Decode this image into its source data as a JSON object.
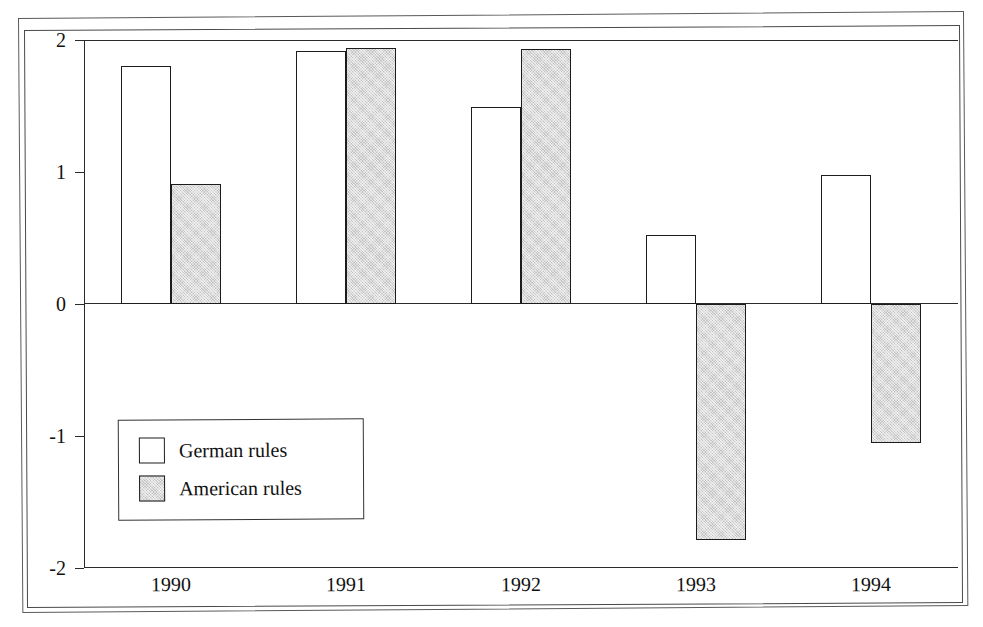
{
  "chart_data": {
    "type": "bar",
    "title": "",
    "subtitle": "",
    "xlabel": "",
    "ylabel": "",
    "categories": [
      "1990",
      "1991",
      "1992",
      "1993",
      "1994"
    ],
    "series": [
      {
        "name": "German rules",
        "values": [
          1.8,
          1.92,
          1.49,
          0.52,
          0.98
        ]
      },
      {
        "name": "American rules",
        "values": [
          0.91,
          1.94,
          1.93,
          -1.79,
          -1.05
        ]
      }
    ],
    "ylim": [
      -2,
      2
    ],
    "yticks": [
      2,
      1,
      0,
      -1,
      -2
    ],
    "ytick_labels": [
      "2",
      "1",
      "0",
      "-1",
      "-2"
    ],
    "grid": false,
    "zero_line": true,
    "legend_position": "inside-lower-left",
    "orientation": "vertical"
  },
  "axes": {
    "y_tick_labels": [
      "2",
      "1",
      "0",
      "-1",
      "-2"
    ],
    "x_tick_labels": [
      "1990",
      "1991",
      "1992",
      "1993",
      "1994"
    ]
  },
  "legend": {
    "entries": [
      {
        "label": "German rules",
        "swatch": "hollow-white-square"
      },
      {
        "label": "American rules",
        "swatch": "filled-gray-square"
      }
    ]
  },
  "colors": {
    "german_fill": "#ffffff",
    "american_fill": "#c3c3c3",
    "bar_outline": "#1c1c1c",
    "axis": "#2b2b2b",
    "text": "#111111",
    "background": "#ffffff"
  }
}
